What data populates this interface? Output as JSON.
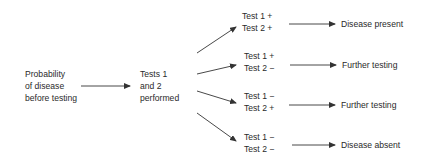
{
  "start": {
    "lines": [
      "Probability",
      "of disease",
      "before testing"
    ]
  },
  "middle": {
    "lines": [
      "Tests 1",
      "and 2",
      "performed"
    ]
  },
  "branches": [
    {
      "test1": "Test 1 +",
      "test2": "Test 2 +",
      "outcome": "Disease present"
    },
    {
      "test1": "Test 1 +",
      "test2": "Test 2 −",
      "outcome": "Further testing"
    },
    {
      "test1": "Test 1 −",
      "test2": "Test 2 +",
      "outcome": "Further testing"
    },
    {
      "test1": "Test 1 −",
      "test2": "Test 2 −",
      "outcome": "Disease absent"
    }
  ],
  "colors": {
    "line": "#333333",
    "text": "#2a2a2a",
    "background": "#ffffff"
  }
}
